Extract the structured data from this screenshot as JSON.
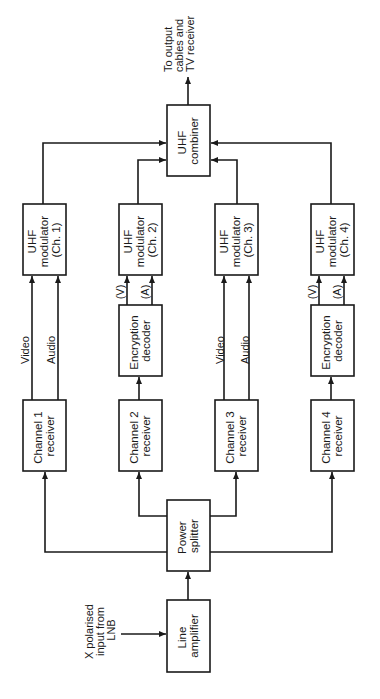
{
  "diagram": {
    "type": "block-diagram",
    "orientation": "rotated-90-ccw",
    "blocks": {
      "line_amplifier": [
        "Line",
        "amplifier"
      ],
      "power_splitter": [
        "Power",
        "splitter"
      ],
      "ch1_receiver": [
        "Channel  1",
        "receiver"
      ],
      "ch2_receiver": [
        "Channel  2",
        "receiver"
      ],
      "ch3_receiver": [
        "Channel  3",
        "receiver"
      ],
      "ch4_receiver": [
        "Channel  4",
        "receiver"
      ],
      "ch2_decoder": [
        "Encryption",
        "decoder"
      ],
      "ch4_decoder": [
        "Encryption",
        "decoder"
      ],
      "ch1_modulator": [
        "UHF",
        "modulator",
        "(Ch. 1)"
      ],
      "ch2_modulator": [
        "UHF",
        "modulator",
        "(Ch. 2)"
      ],
      "ch3_modulator": [
        "UHF",
        "modulator",
        "(Ch. 3)"
      ],
      "ch4_modulator": [
        "UHF",
        "modulator",
        "(Ch. 4)"
      ],
      "combiner": [
        "UHF",
        "combiner"
      ]
    },
    "signals": {
      "video": "Video",
      "audio": "Audio",
      "v": "(V)",
      "a": "(A)"
    },
    "input_label": [
      "X polarised",
      "input from",
      "LNB"
    ],
    "output_label": [
      "To output",
      "cables and",
      "TV receiver"
    ],
    "stroke_color": "#1a1a1a",
    "background": "#ffffff"
  }
}
